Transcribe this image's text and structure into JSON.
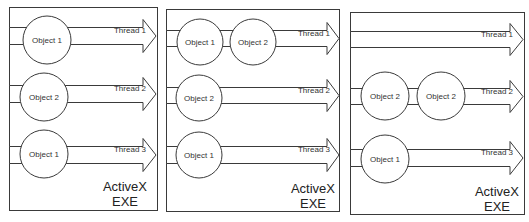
{
  "diagram": {
    "colors": {
      "stroke": "#3a3a3a",
      "fill": "#ffffff",
      "text": "#333333"
    },
    "panels": [
      {
        "id": "panel-1",
        "box": {
          "x": 9,
          "y": 7,
          "w": 148,
          "h": 203
        },
        "exe_label": [
          "ActiveX",
          "EXE"
        ],
        "exe_label_pos": {
          "x": 125,
          "y1": 191,
          "y2": 206
        },
        "threads": [
          {
            "label": "Thread 1",
            "band": {
              "y1": 27,
              "y2": 44
            },
            "head_tip_x": 156,
            "head_base_x": 143,
            "head_pad": 8,
            "label_x": 130,
            "objects": [
              {
                "label": "Object 1",
                "cx": 47,
                "cy": 40,
                "r": 24
              }
            ]
          },
          {
            "label": "Thread 2",
            "band": {
              "y1": 85,
              "y2": 102
            },
            "head_tip_x": 156,
            "head_base_x": 143,
            "head_pad": 8,
            "label_x": 130,
            "objects": [
              {
                "label": "Object 2",
                "cx": 44,
                "cy": 97,
                "r": 24
              }
            ]
          },
          {
            "label": "Thread 3",
            "band": {
              "y1": 146,
              "y2": 163
            },
            "head_tip_x": 156,
            "head_base_x": 143,
            "head_pad": 8,
            "label_x": 130,
            "objects": [
              {
                "label": "Object 1",
                "cx": 44,
                "cy": 154,
                "r": 24
              }
            ]
          }
        ]
      },
      {
        "id": "panel-2",
        "box": {
          "x": 166,
          "y": 9,
          "w": 173,
          "h": 202
        },
        "exe_label": [
          "ActiveX",
          "EXE"
        ],
        "exe_label_pos": {
          "x": 313,
          "y1": 193,
          "y2": 208
        },
        "threads": [
          {
            "label": "Thread 1",
            "band": {
              "y1": 30,
              "y2": 46
            },
            "head_tip_x": 339,
            "head_base_x": 327,
            "head_pad": 8,
            "label_x": 314,
            "objects": [
              {
                "label": "Object 1",
                "cx": 200,
                "cy": 42,
                "r": 23
              },
              {
                "label": "Object 2",
                "cx": 253,
                "cy": 42,
                "r": 23
              }
            ]
          },
          {
            "label": "Thread 2",
            "band": {
              "y1": 87,
              "y2": 103
            },
            "head_tip_x": 339,
            "head_base_x": 327,
            "head_pad": 8,
            "label_x": 314,
            "objects": [
              {
                "label": "Object 2",
                "cx": 199,
                "cy": 98,
                "r": 23
              }
            ]
          },
          {
            "label": "Thread 3",
            "band": {
              "y1": 146,
              "y2": 163
            },
            "head_tip_x": 339,
            "head_base_x": 327,
            "head_pad": 8,
            "label_x": 314,
            "objects": [
              {
                "label": "Object 1",
                "cx": 199,
                "cy": 155,
                "r": 23
              }
            ]
          }
        ]
      },
      {
        "id": "panel-3",
        "box": {
          "x": 350,
          "y": 12,
          "w": 174,
          "h": 202
        },
        "exe_label": [
          "ActiveX",
          "EXE"
        ],
        "exe_label_pos": {
          "x": 497,
          "y1": 196,
          "y2": 211
        },
        "threads": [
          {
            "label": "Thread 1",
            "band": {
              "y1": 31,
              "y2": 47
            },
            "head_tip_x": 523,
            "head_base_x": 510,
            "head_pad": 8,
            "label_x": 497,
            "objects": []
          },
          {
            "label": "Thread 2",
            "band": {
              "y1": 88,
              "y2": 104
            },
            "head_tip_x": 523,
            "head_base_x": 510,
            "head_pad": 8,
            "label_x": 497,
            "objects": [
              {
                "label": "Object 2",
                "cx": 385,
                "cy": 96,
                "r": 24
              },
              {
                "label": "Object 2",
                "cx": 441,
                "cy": 96,
                "r": 24
              }
            ]
          },
          {
            "label": "Thread 3",
            "band": {
              "y1": 149,
              "y2": 166
            },
            "head_tip_x": 523,
            "head_base_x": 510,
            "head_pad": 8,
            "label_x": 497,
            "objects": [
              {
                "label": "Object 1",
                "cx": 385,
                "cy": 159,
                "r": 24
              }
            ]
          }
        ]
      }
    ]
  }
}
